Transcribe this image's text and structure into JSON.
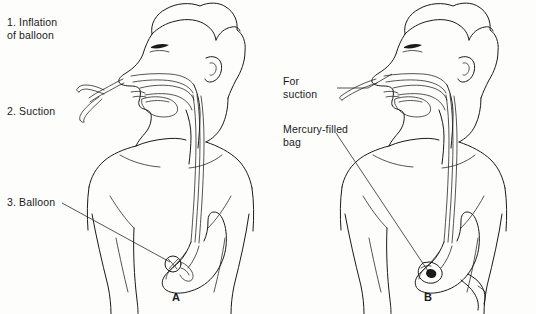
{
  "figure": {
    "background_color": "#fdfdfc",
    "line_color": "#1a1a1a",
    "style": "black-and-white line drawing"
  },
  "panels": [
    {
      "letter": "A",
      "description": "Lateral view of head and torso with nasogastric tube inserted through the nose, down the esophagus into the stomach, with an inflatable balloon at the distal tip",
      "labels": [
        {
          "id": "inflation",
          "text": "1. Inflation\n    of balloon",
          "leader": false
        },
        {
          "id": "suction",
          "text": "2. Suction",
          "leader": false
        },
        {
          "id": "balloon",
          "text": "3. Balloon",
          "leader": true
        }
      ]
    },
    {
      "letter": "B",
      "description": "Lateral view of head and torso with intestinal tube passed through the nose into the stomach and advanced toward the duodenum, with a mercury-filled bag at the tip",
      "labels": [
        {
          "id": "for-suction",
          "text": "For\nsuction",
          "leader": true
        },
        {
          "id": "mercury-bag",
          "text": "Mercury-filled\nbag",
          "leader": true
        }
      ]
    }
  ],
  "anatomy": {
    "structures": [
      "head-profile",
      "hair",
      "eye",
      "nose",
      "lips",
      "ear",
      "nasal-cavity",
      "oral-cavity",
      "tongue",
      "pharynx",
      "neck",
      "shoulders",
      "chest",
      "arms",
      "esophagus",
      "stomach",
      "duodenum"
    ],
    "devices": [
      "nasogastric-tube",
      "tube-bifurcation",
      "inflation-port",
      "suction-port",
      "gastric-balloon",
      "mercury-filled-bag"
    ]
  }
}
